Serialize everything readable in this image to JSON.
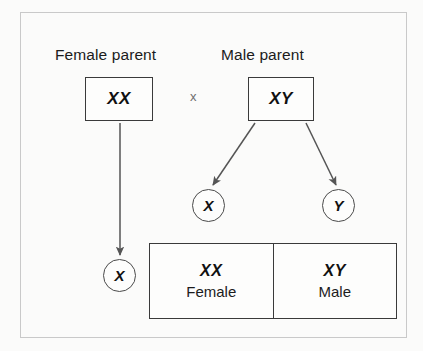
{
  "diagram": {
    "colors": {
      "background": "#fbfbfa",
      "frame": "#c9c9c9",
      "box_border": "#3a3a3a",
      "circle_border": "#4a4a4a",
      "text": "#111111",
      "cross_symbol": "#6e6e6e",
      "arrow": "#555555"
    },
    "parents": [
      {
        "label": "Female parent",
        "genotype": "XX"
      },
      {
        "label": "Male parent",
        "genotype": "XY"
      }
    ],
    "cross_symbol": "x",
    "gametes": [
      {
        "name": "maternal-x",
        "allele": "X",
        "from": "Female parent"
      },
      {
        "name": "paternal-x",
        "allele": "X",
        "from": "Male parent"
      },
      {
        "name": "paternal-y",
        "allele": "Y",
        "from": "Male parent"
      }
    ],
    "offspring": [
      {
        "genotype": "XX",
        "sex": "Female"
      },
      {
        "genotype": "XY",
        "sex": "Male"
      }
    ]
  }
}
